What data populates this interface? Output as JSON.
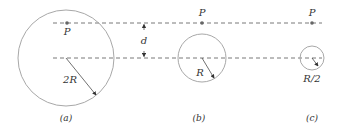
{
  "diagram": {
    "colors": {
      "circle": "#a8a8a8",
      "dash": "#555555",
      "dot": "#666666",
      "text": "#333333",
      "arrow": "#333333"
    },
    "separation_label": "d",
    "panels": [
      {
        "id": "a",
        "caption": "(a)",
        "point_label": "P",
        "radius_label": "2R"
      },
      {
        "id": "b",
        "caption": "(b)",
        "point_label": "P",
        "radius_label": "R"
      },
      {
        "id": "c",
        "caption": "(c)",
        "point_label": "P",
        "radius_label": "R/2"
      }
    ]
  }
}
